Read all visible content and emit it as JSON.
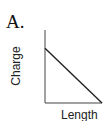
{
  "panel": {
    "label": "A."
  },
  "chart_data": {
    "type": "line",
    "title": "",
    "xlabel": "Length",
    "ylabel": "Charge",
    "x": [
      0,
      1
    ],
    "series": [
      {
        "name": "Charge vs Length",
        "values": [
          0.75,
          0
        ]
      }
    ],
    "xlim": [
      0,
      1
    ],
    "ylim": [
      0,
      1
    ],
    "ticks": "none",
    "grid": false,
    "legend": "none"
  }
}
